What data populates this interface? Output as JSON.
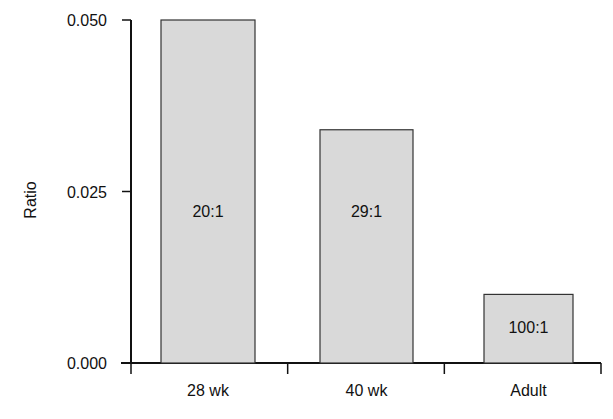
{
  "chart_data": {
    "type": "bar",
    "title": "",
    "xlabel": "",
    "ylabel": "Ratio",
    "ylim": [
      0.0,
      0.05
    ],
    "yticks": [
      "0.000",
      "0.025",
      "0.050"
    ],
    "categories": [
      "28 wk",
      "40 wk",
      "Adult"
    ],
    "values": [
      0.05,
      0.034,
      0.01
    ],
    "bar_labels": [
      "20:1",
      "29:1",
      "100:1"
    ],
    "grid": false,
    "legend": null,
    "colors": {
      "bar_fill": "#d9d9d9",
      "bar_stroke": "#333333",
      "axis": "#111111"
    }
  }
}
